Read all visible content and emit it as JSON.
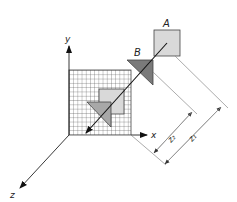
{
  "diagram": {
    "labels": {
      "A": "A",
      "B": "B",
      "x_axis": "x",
      "y_axis": "y",
      "z_axis": "z",
      "z1": "z₁",
      "z2": "z₂"
    },
    "colors": {
      "line": "#222222",
      "grid": "#555555",
      "square_fill": "#d9d9d9",
      "triangle_dark": "#7a7a7a",
      "triangle_light": "#a8a8a8",
      "dim_line": "#888888"
    }
  }
}
